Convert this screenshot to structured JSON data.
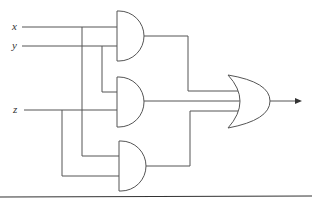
{
  "diagram": {
    "type": "logic-circuit",
    "inputs": [
      {
        "label": "x"
      },
      {
        "label": "y"
      },
      {
        "label": "z"
      }
    ],
    "gates": [
      {
        "id": "and1",
        "type": "AND",
        "inputs": [
          "x",
          "y"
        ]
      },
      {
        "id": "and2",
        "type": "AND",
        "inputs": [
          "y",
          "z"
        ]
      },
      {
        "id": "and3",
        "type": "AND",
        "inputs": [
          "x",
          "z"
        ]
      },
      {
        "id": "or1",
        "type": "OR",
        "inputs": [
          "and1",
          "and2",
          "and3"
        ]
      }
    ],
    "output": {
      "arrow": true
    }
  }
}
